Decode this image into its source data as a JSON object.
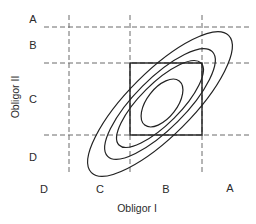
{
  "diagram": {
    "type": "joint-rating-contour-diagram",
    "x_axis": {
      "title": "Obligor I",
      "grade_labels": [
        "D",
        "C",
        "B",
        "A"
      ]
    },
    "y_axis": {
      "title": "Obligor II",
      "grade_labels": [
        "A",
        "B",
        "C",
        "D"
      ]
    },
    "elements": {
      "dashed_grid_lines": {
        "vertical_count": 3,
        "horizontal_count": 3
      },
      "solid_box": "B-B region (Obligor I grade B × Obligor II grade C-band)",
      "concentric_ellipses": 4,
      "ellipse_orientation": "positively correlated (lower-left to upper-right)"
    },
    "colors": {
      "lines": "#222222",
      "dashed": "#6a6a6a",
      "text": "#2a2a2a",
      "background": "#ffffff"
    }
  }
}
